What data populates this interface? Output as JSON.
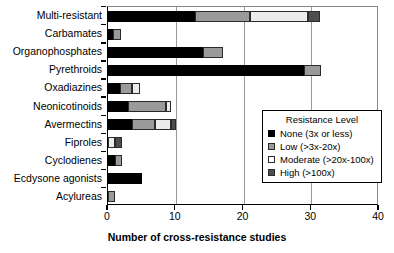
{
  "chart_data": {
    "type": "bar",
    "orientation": "horizontal",
    "stacked": true,
    "title": "",
    "xlabel": "Number of cross-resistance studies",
    "ylabel": "",
    "xlim": [
      0,
      40
    ],
    "xticks": [
      0,
      10,
      20,
      30,
      40
    ],
    "grid": true,
    "grid_axis": "x",
    "legend": {
      "title": "Resistance Level",
      "position": "inside-right",
      "entries": [
        {
          "name": "None (3x or less)",
          "color": "#000000",
          "key": "none"
        },
        {
          "name": "Low (>3x-20x)",
          "color": "#9a9a9a",
          "key": "low"
        },
        {
          "name": "Moderate (>20x-100x)",
          "color": "#ffffff",
          "key": "moderate"
        },
        {
          "name": "High (>100x)",
          "color": "#4d4d4d",
          "key": "high"
        }
      ]
    },
    "categories": [
      "Multi-resistant",
      "Carbamates",
      "Organophosphates",
      "Pyrethroids",
      "Oxadiazines",
      "Neonicotinoids",
      "Avermectins",
      "Fiproles",
      "Cyclodienes",
      "Ecdysone agonists",
      "Acylureas"
    ],
    "series": [
      {
        "name": "None (3x or less)",
        "values": [
          12.8,
          0.8,
          14.0,
          29.0,
          1.7,
          3.0,
          3.5,
          0.0,
          1.0,
          5.0,
          0.0
        ]
      },
      {
        "name": "Low (>3x-20x)",
        "values": [
          8.2,
          1.1,
          3.0,
          2.5,
          1.8,
          5.5,
          3.5,
          0.0,
          1.0,
          0.0,
          1.0
        ]
      },
      {
        "name": "Moderate (>20x-100x)",
        "values": [
          8.5,
          0.0,
          0.0,
          0.0,
          1.2,
          0.8,
          2.3,
          1.0,
          0.0,
          0.0,
          0.0
        ]
      },
      {
        "name": "High (>100x)",
        "values": [
          1.8,
          0.0,
          0.0,
          0.0,
          0.0,
          0.0,
          0.7,
          1.0,
          0.0,
          0.0,
          0.0
        ]
      }
    ],
    "totals": [
      31.3,
      1.9,
      17.0,
      31.5,
      4.7,
      9.3,
      10.0,
      2.0,
      2.0,
      5.0,
      1.0
    ]
  }
}
